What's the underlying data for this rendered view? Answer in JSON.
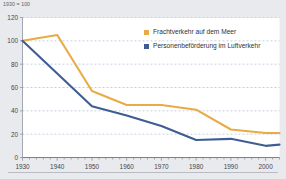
{
  "figure": {
    "unit_note": "1930 = 100",
    "background_color": "#e8eaee",
    "plot_background_color": "#ffffff"
  },
  "legend": {
    "position": "top-right-inside",
    "entries": [
      {
        "label": "Frachtverkehr auf dem Meer",
        "color": "#e8ab46"
      },
      {
        "label": "Personenbeförderung im Luftverkehr",
        "color": "#3f5d92"
      }
    ]
  },
  "axes": {
    "y_ticks": [
      "0",
      "20",
      "40",
      "60",
      "80",
      "100",
      "120"
    ],
    "x_ticks": [
      "1930",
      "1940",
      "1950",
      "1960",
      "1970",
      "1980",
      "1990",
      "2000"
    ]
  },
  "chart_data": {
    "type": "line",
    "title": "",
    "subtitle": "",
    "xlabel": "",
    "ylabel": "",
    "unit_note": "1930 = 100",
    "xlim": [
      1930,
      2004
    ],
    "ylim": [
      0,
      120
    ],
    "grid": true,
    "grid_style": "dashed-horizontal",
    "grid_color": "#aebbd0",
    "legend_position": "top-right-inside",
    "x": [
      1930,
      1940,
      1950,
      1960,
      1970,
      1980,
      1990,
      2000,
      2004
    ],
    "x_tick_values": [
      1930,
      1940,
      1950,
      1960,
      1970,
      1980,
      1990,
      2000
    ],
    "y_tick_values": [
      0,
      20,
      40,
      60,
      80,
      100,
      120
    ],
    "minor_tick_interval": 2,
    "series": [
      {
        "name": "Frachtverkehr auf dem Meer",
        "color": "#e8ab46",
        "values": [
          100,
          105,
          57,
          45,
          45,
          41,
          24,
          21,
          21
        ]
      },
      {
        "name": "Personenbeförderung im Luftverkehr",
        "color": "#3f5d92",
        "values": [
          100,
          72,
          44,
          36,
          27,
          15,
          16,
          10,
          11
        ]
      }
    ]
  }
}
